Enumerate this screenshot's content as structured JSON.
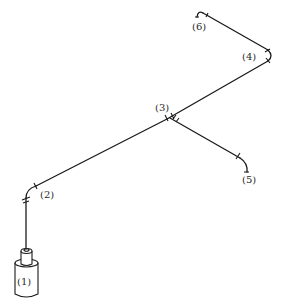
{
  "diagram": {
    "type": "isometric piping diagram",
    "colors": {
      "line": "#1a1a1a",
      "background": "#ffffff",
      "label": "#2a2a2a"
    },
    "nodes": [
      {
        "id": "1",
        "label": "(1)",
        "kind": "tank / vessel"
      },
      {
        "id": "2",
        "label": "(2)",
        "kind": "elbow"
      },
      {
        "id": "3",
        "label": "(3)",
        "kind": "tee"
      },
      {
        "id": "4",
        "label": "(4)",
        "kind": "elbow"
      },
      {
        "id": "5",
        "label": "(5)",
        "kind": "elbow / outlet"
      },
      {
        "id": "6",
        "label": "(6)",
        "kind": "elbow / outlet"
      }
    ],
    "edges": [
      {
        "from": "1",
        "to": "2"
      },
      {
        "from": "2",
        "to": "3"
      },
      {
        "from": "3",
        "to": "4"
      },
      {
        "from": "4",
        "to": "6"
      },
      {
        "from": "3",
        "to": "5"
      }
    ]
  }
}
